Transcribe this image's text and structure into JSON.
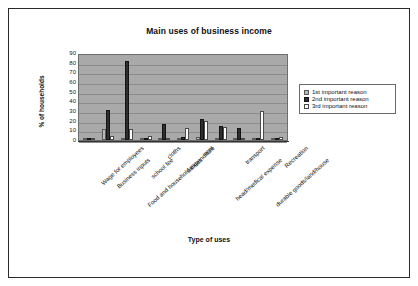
{
  "page": {
    "background_color": "#ffffff",
    "border_color": "#2a2a2a"
  },
  "chart_data": {
    "type": "bar",
    "title": "Main uses of business income",
    "xlabel": "Type of uses",
    "ylabel": "% of households",
    "ylim": [
      0,
      90
    ],
    "ytick_step": 10,
    "yticks": [
      "90",
      "80",
      "70",
      "60",
      "50",
      "40",
      "30",
      "20",
      "10",
      "0"
    ],
    "grid": true,
    "grid_axis": "y",
    "legend_position": "right",
    "plot_background_color": "#a9a9a9",
    "categories": [
      "Wage for employees",
      "Business inputs",
      "Food and household expenditure",
      "school fee",
      "cloths",
      "utilities",
      "rent",
      "head/medical expense",
      "transport",
      "durable goods/land/house",
      "Recreation"
    ],
    "series": [
      {
        "name": "1st important reason",
        "color": "#b9b9b9",
        "values": [
          2,
          11,
          2,
          2,
          1,
          2,
          3,
          2,
          2,
          1,
          1
        ]
      },
      {
        "name": "2nd important reason",
        "color": "#2e2e2e",
        "values": [
          2,
          31,
          82,
          2,
          17,
          3,
          22,
          14,
          12,
          2,
          1
        ]
      },
      {
        "name": "3rd important reason",
        "color": "#ffffff",
        "values": [
          1,
          4,
          11,
          4,
          2,
          12,
          20,
          13,
          1,
          30,
          3
        ]
      }
    ]
  }
}
